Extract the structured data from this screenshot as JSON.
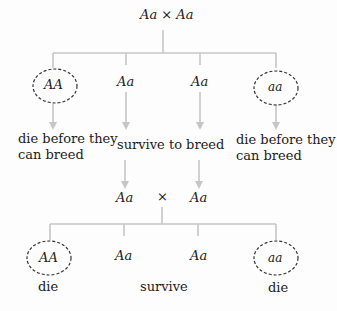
{
  "diagram": {
    "top_cross": "Aa × Aa",
    "generation1": [
      {
        "genotype": "AA",
        "circled": true,
        "label": "die before they\ncan breed"
      },
      {
        "genotype": "Aa",
        "circled": false
      },
      {
        "genotype": "Aa",
        "circled": false
      },
      {
        "genotype": "aa",
        "circled": true,
        "label": "die before they\ncan breed"
      }
    ],
    "middle_label": "survive to breed",
    "second_cross": {
      "left": "Aa",
      "symbol": "×",
      "right": "Aa"
    },
    "generation2": [
      {
        "genotype": "AA",
        "circled": true,
        "label": "die"
      },
      {
        "genotype": "Aa",
        "circled": false
      },
      {
        "genotype": "Aa",
        "circled": false
      },
      {
        "genotype": "aa",
        "circled": true,
        "label": "die"
      }
    ],
    "bottom_middle_label": "survive",
    "colors": {
      "lines": "#c8c8c8",
      "circle": "#333333",
      "text": "#1a1a1a"
    }
  }
}
